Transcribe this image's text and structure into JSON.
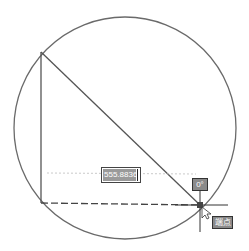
{
  "drawing": {
    "circle": {
      "cx": 125,
      "cy": 128,
      "r": 111,
      "color": "#6a6a6a"
    },
    "triangle": {
      "top_left": [
        41,
        52
      ],
      "bottom_left": [
        41,
        203
      ],
      "bottom_right": [
        200,
        205
      ],
      "color": "#555555"
    }
  },
  "dimension_input": {
    "value": "555.8836"
  },
  "angle_tooltip": {
    "text": "0°"
  },
  "snap_tooltip": {
    "text": "端点"
  },
  "cursor": {
    "x": 200,
    "y": 205
  }
}
